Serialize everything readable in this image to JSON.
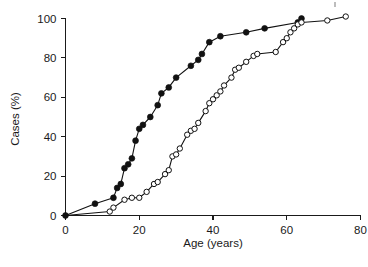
{
  "figure": {
    "background": "#ffffff",
    "ink_color": "#111111"
  },
  "chart_data": {
    "type": "line",
    "title": "",
    "subtitle": "",
    "xlabel": "Age (years)",
    "ylabel": "Cases (%)",
    "xlim": [
      0,
      80
    ],
    "ylim": [
      0,
      100
    ],
    "xticks": [
      0,
      20,
      40,
      60,
      80
    ],
    "yticks": [
      0,
      20,
      40,
      60,
      80,
      100
    ],
    "xtick_labels": [
      "0",
      "20",
      "40",
      "60",
      "80"
    ],
    "ytick_labels": [
      "0",
      "20",
      "40",
      "60",
      "80",
      "100"
    ],
    "grid": false,
    "legend": "none",
    "annotations": [],
    "series": [
      {
        "name": "filled-circles",
        "marker": "filled-circle",
        "marker_fill": "#111111",
        "marker_stroke": "#111111",
        "line_color": "#111111",
        "points": [
          [
            0,
            0
          ],
          [
            8,
            6
          ],
          [
            13,
            9
          ],
          [
            14,
            14
          ],
          [
            15,
            16
          ],
          [
            16,
            24
          ],
          [
            17,
            26
          ],
          [
            18,
            29
          ],
          [
            19,
            38
          ],
          [
            20,
            44
          ],
          [
            21,
            46
          ],
          [
            23,
            50
          ],
          [
            25,
            56
          ],
          [
            26,
            62
          ],
          [
            28,
            65
          ],
          [
            30,
            70
          ],
          [
            34,
            76
          ],
          [
            36,
            79
          ],
          [
            37,
            82
          ],
          [
            39,
            88
          ],
          [
            42,
            91
          ],
          [
            49,
            93
          ],
          [
            54,
            95
          ],
          [
            63,
            98
          ],
          [
            64,
            100
          ]
        ]
      },
      {
        "name": "open-circles",
        "marker": "open-circle",
        "marker_fill": "#ffffff",
        "marker_stroke": "#111111",
        "line_color": "#111111",
        "points": [
          [
            0,
            0
          ],
          [
            12,
            2
          ],
          [
            13,
            4
          ],
          [
            16,
            8
          ],
          [
            18,
            9
          ],
          [
            20,
            9
          ],
          [
            22,
            12
          ],
          [
            24,
            16
          ],
          [
            25,
            17
          ],
          [
            27,
            21
          ],
          [
            28,
            23
          ],
          [
            29,
            30
          ],
          [
            30,
            31
          ],
          [
            31,
            34
          ],
          [
            33,
            41
          ],
          [
            34,
            43
          ],
          [
            35,
            44
          ],
          [
            36,
            47
          ],
          [
            38,
            53
          ],
          [
            39,
            57
          ],
          [
            40,
            59
          ],
          [
            41,
            61
          ],
          [
            42,
            63
          ],
          [
            43,
            66
          ],
          [
            45,
            70
          ],
          [
            46,
            74
          ],
          [
            47,
            75
          ],
          [
            49,
            78
          ],
          [
            51,
            81
          ],
          [
            52,
            82
          ],
          [
            57,
            83
          ],
          [
            59,
            88
          ],
          [
            60,
            90
          ],
          [
            61,
            93
          ],
          [
            62,
            95
          ],
          [
            63,
            97
          ],
          [
            64,
            98
          ],
          [
            71,
            99
          ],
          [
            76,
            101
          ]
        ]
      }
    ]
  }
}
